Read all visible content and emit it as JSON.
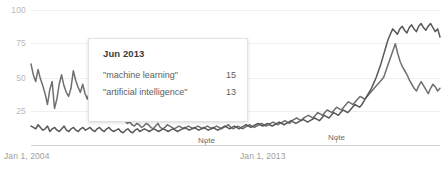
{
  "chart_data": {
    "type": "line",
    "title": "",
    "xlabel": "",
    "ylabel": "",
    "ylim": [
      0,
      100
    ],
    "grid": true,
    "legend_position": "none",
    "y_ticks": [
      "100",
      "75",
      "50",
      "25"
    ],
    "y_tick_values": [
      100,
      75,
      50,
      25
    ],
    "x_ticks": [
      "Jan 1, 2004",
      "Jan 1, 2013"
    ],
    "annotations": [
      {
        "label": "Note",
        "x_approx": "2010"
      },
      {
        "label": "Note",
        "x_approx": "2016"
      }
    ],
    "series": [
      {
        "name": "\"artificial intelligence\"",
        "color": "#6f6f6f",
        "values": [
          60,
          52,
          47,
          56,
          49,
          44,
          38,
          30,
          41,
          47,
          27,
          34,
          45,
          52,
          44,
          39,
          36,
          42,
          55,
          48,
          43,
          39,
          45,
          38,
          34,
          40,
          36,
          31,
          28,
          33,
          38,
          30,
          26,
          22,
          24,
          21,
          19,
          22,
          25,
          21,
          18,
          16,
          17,
          15,
          14,
          16,
          15,
          13,
          14,
          16,
          15,
          13,
          12,
          14,
          16,
          13,
          12,
          13,
          15,
          14,
          13,
          12,
          13,
          14,
          13,
          12,
          13,
          14,
          13,
          12,
          13,
          14,
          13,
          12,
          13,
          14,
          13,
          12,
          13,
          14,
          13,
          12,
          13,
          14,
          15,
          13,
          12,
          13,
          14,
          13,
          12,
          13,
          14,
          15,
          14,
          13,
          14,
          15,
          16,
          15,
          14,
          15,
          16,
          17,
          16,
          15,
          16,
          17,
          18,
          17,
          16,
          18,
          19,
          20,
          19,
          18,
          20,
          21,
          22,
          21,
          20,
          22,
          24,
          23,
          22,
          24,
          26,
          25,
          24,
          26,
          28,
          27,
          26,
          28,
          30,
          32,
          31,
          30,
          32,
          34,
          36,
          35,
          34,
          36,
          38,
          40,
          42,
          44,
          46,
          48,
          50,
          55,
          60,
          65,
          70,
          75,
          68,
          62,
          58,
          55,
          52,
          48,
          45,
          42,
          40,
          44,
          47,
          44,
          41,
          38,
          42,
          45,
          43,
          40,
          42
        ]
      },
      {
        "name": "\"machine learning\"",
        "color": "#585858",
        "values": [
          14,
          13,
          12,
          15,
          13,
          11,
          12,
          14,
          10,
          12,
          13,
          11,
          10,
          12,
          14,
          11,
          10,
          12,
          13,
          11,
          10,
          12,
          13,
          11,
          12,
          13,
          11,
          10,
          12,
          13,
          11,
          10,
          12,
          13,
          11,
          10,
          11,
          12,
          10,
          9,
          11,
          12,
          10,
          9,
          11,
          12,
          10,
          11,
          12,
          11,
          10,
          11,
          12,
          11,
          10,
          11,
          12,
          11,
          10,
          11,
          12,
          11,
          10,
          11,
          12,
          13,
          12,
          11,
          12,
          13,
          12,
          11,
          12,
          13,
          12,
          11,
          12,
          13,
          12,
          11,
          12,
          13,
          14,
          13,
          12,
          13,
          14,
          13,
          12,
          13,
          14,
          15,
          14,
          13,
          14,
          15,
          16,
          15,
          14,
          15,
          16,
          15,
          14,
          15,
          16,
          17,
          16,
          15,
          16,
          17,
          18,
          17,
          16,
          17,
          18,
          19,
          18,
          17,
          18,
          19,
          20,
          19,
          18,
          20,
          22,
          21,
          20,
          22,
          24,
          23,
          22,
          24,
          26,
          25,
          24,
          26,
          28,
          30,
          29,
          28,
          30,
          33,
          36,
          39,
          42,
          46,
          50,
          55,
          60,
          66,
          72,
          78,
          82,
          86,
          84,
          82,
          86,
          88,
          85,
          83,
          87,
          89,
          86,
          84,
          88,
          90,
          87,
          85,
          88,
          90,
          87,
          84,
          86,
          80
        ]
      }
    ]
  },
  "tooltip": {
    "title": "Jun 2013",
    "rows": [
      {
        "term": "\"machine learning\"",
        "value": "15"
      },
      {
        "term": "\"artificial intelligence\"",
        "value": "13"
      }
    ]
  },
  "axis": {
    "y_labels": [
      "100",
      "75",
      "50",
      "25"
    ],
    "x_labels": [
      "Jan 1, 2004",
      "Jan 1, 2013"
    ]
  },
  "notes": [
    {
      "label": "Note"
    },
    {
      "label": "Note"
    }
  ],
  "colors": {
    "series_a": "#6f6f6f",
    "series_b": "#585858",
    "gridline": "#efefef",
    "axisline": "#d4d4d4",
    "tick_text": "#b9b9b9",
    "xtick_text": "#9e9e9e",
    "tooltip_bg": "#ffffff",
    "tooltip_border": "#e2e2e2"
  }
}
